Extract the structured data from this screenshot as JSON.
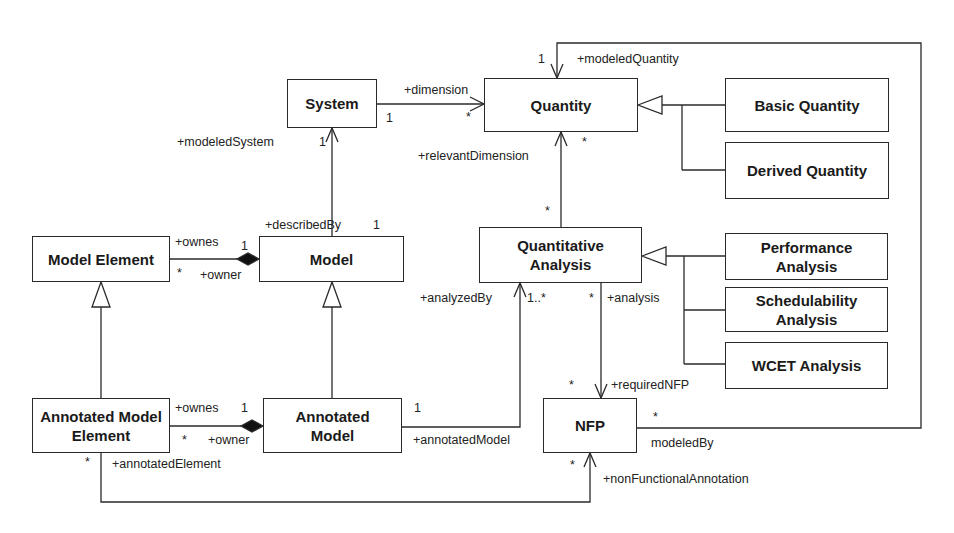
{
  "diagram": {
    "type": "UML class diagram",
    "classes": {
      "system": "System",
      "quantity": "Quantity",
      "basic_quantity": "Basic Quantity",
      "derived_quantity": "Derived Quantity",
      "model_element": "Model Element",
      "model": "Model",
      "quantitative_analysis": "Quantitative Analysis",
      "performance_analysis": "Performance Analysis",
      "schedulability_analysis": "Schedulability Analysis",
      "wcet_analysis": "WCET Analysis",
      "annotated_model_element": "Annotated Model Element",
      "annotated_model": "Annotated Model",
      "nfp": "NFP"
    },
    "labels": {
      "modeled_quantity": "+modeledQuantity",
      "modeled_quantity_mult": "1",
      "dimension": "+dimension",
      "dimension_src_mult": "1",
      "dimension_tgt_mult": "*",
      "relevant_dimension": "+relevantDimension",
      "quantity_bottom_mult": "*",
      "qa_top_mult": "*",
      "modeled_system": "+modeledSystem",
      "modeled_system_mult": "1",
      "described_by": "+describedBy",
      "described_by_mult": "1",
      "ownes_top": "+ownes",
      "ownes_top_mult": "1",
      "owner_top": "+owner",
      "owner_top_mult": "*",
      "analyzed_by": "+analyzedBy",
      "analyzed_by_mult": "1..*",
      "analysis": "+analysis",
      "analysis_mult": "*",
      "required_nfp": "+requiredNFP",
      "required_nfp_mult": "*",
      "ownes_bottom": "+ownes",
      "ownes_bottom_mult": "1",
      "owner_bottom": "+owner",
      "owner_bottom_mult": "*",
      "annotated_model_mult": "1",
      "annotated_model": "+annotatedModel",
      "annotated_element": "+annotatedElement",
      "annotated_element_mult": "*",
      "nfp_right_mult": "*",
      "modeled_by": "modeledBy",
      "nfp_bottom_mult": "*",
      "non_functional_annotation": "+nonFunctionalAnnotation"
    }
  }
}
